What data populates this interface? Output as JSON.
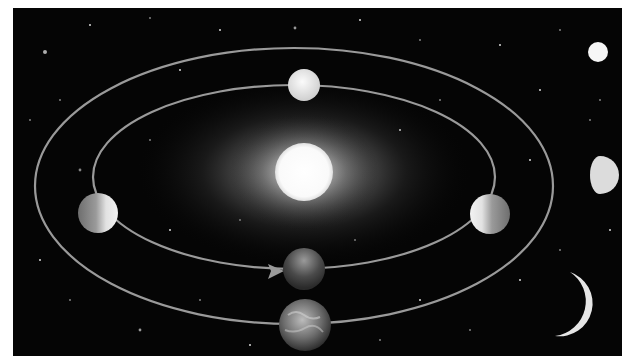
{
  "diagram": {
    "colors": {
      "background": "#050505",
      "page": "#ffffff",
      "orbit": "#9a9a9a",
      "sun": "#fdfdfd",
      "glow": "#cfcfcf"
    },
    "panel": {
      "x": 13,
      "y": 8,
      "w": 609,
      "h": 348
    },
    "sun": {
      "name": "sun",
      "cx": 304,
      "cy": 172,
      "r": 29
    },
    "orbits": [
      {
        "name": "venus-orbit",
        "cx": 294,
        "cy": 177,
        "rx": 201,
        "ry": 92
      },
      {
        "name": "earth-orbit",
        "cx": 294,
        "cy": 186,
        "rx": 259,
        "ry": 138
      }
    ],
    "direction_arrow": {
      "x1": 120,
      "y1": 240,
      "tip_x": 283,
      "tip_y": 272
    },
    "venus_positions": [
      {
        "name": "venus-far",
        "cx": 304,
        "cy": 85,
        "r": 16,
        "lit": "full"
      },
      {
        "name": "venus-left",
        "cx": 98,
        "cy": 213,
        "r": 20,
        "lit": "right"
      },
      {
        "name": "venus-right",
        "cx": 490,
        "cy": 214,
        "r": 20,
        "lit": "left"
      },
      {
        "name": "venus-near",
        "cx": 304,
        "cy": 269,
        "r": 21,
        "lit": "dark"
      }
    ],
    "earth": {
      "name": "earth",
      "cx": 305,
      "cy": 325,
      "r": 26
    },
    "observed_phases": [
      {
        "name": "phase-full",
        "cx": 598,
        "cy": 52,
        "r": 10
      },
      {
        "name": "phase-half",
        "cx": 600,
        "cy": 175,
        "r": 19
      },
      {
        "name": "phase-crescent",
        "cx": 582,
        "cy": 305,
        "r": 34
      }
    ]
  }
}
